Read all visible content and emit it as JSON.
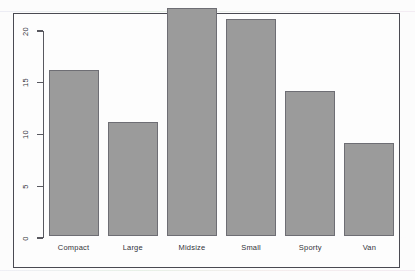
{
  "chart_data": {
    "type": "bar",
    "title": "",
    "subtitle": "",
    "xlabel": "",
    "ylabel": "",
    "categories": [
      "Compact",
      "Large",
      "Midsize",
      "Small",
      "Sporty",
      "Van"
    ],
    "values": [
      16,
      11,
      22,
      21,
      14,
      9
    ],
    "ylim": [
      0,
      22
    ],
    "yticks": [
      0,
      5,
      10,
      15,
      20
    ],
    "ytick_labels": [
      "0",
      "5",
      "10",
      "15",
      "20"
    ],
    "ytick_label_rotation": "vertical",
    "grid": false,
    "legend": null,
    "bar_fill_color": "#9b9b9b",
    "bar_border_color": "#6e6e74",
    "axis_color": "#58585f",
    "frame_color": "#4a4a52",
    "background_color": "#fdfdfd"
  },
  "axis": {
    "ticks": [
      {
        "label": "0",
        "value": 0
      },
      {
        "label": "5",
        "value": 5
      },
      {
        "label": "10",
        "value": 10
      },
      {
        "label": "15",
        "value": 15
      },
      {
        "label": "20",
        "value": 20
      }
    ]
  },
  "bars": [
    {
      "label": "Compact",
      "value": 16
    },
    {
      "label": "Large",
      "value": 11
    },
    {
      "label": "Midsize",
      "value": 22
    },
    {
      "label": "Small",
      "value": 21
    },
    {
      "label": "Sporty",
      "value": 14
    },
    {
      "label": "Van",
      "value": 9
    }
  ]
}
